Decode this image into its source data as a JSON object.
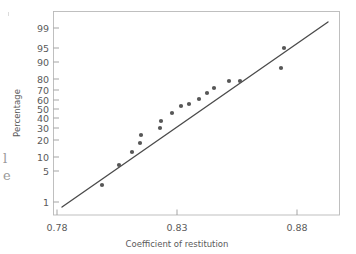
{
  "figure": {
    "kind": "normal-probability-plot",
    "background_color": "#ffffff",
    "line_color": "#4b4b4b",
    "point_color": "#575757",
    "frame_color": "#b9b9b9",
    "text_color": "#5a5a5a"
  },
  "margin_notes": {
    "line1": "l",
    "line2": "e"
  },
  "chart_data": {
    "type": "scatter",
    "title": "",
    "subtitle": "",
    "xlabel": "Coefficient of restitution",
    "ylabel": "Percentage",
    "xlim": [
      0.78,
      0.885
    ],
    "x_ticks": [
      0.78,
      0.83,
      0.88
    ],
    "x_tick_labels": [
      "0.78",
      "0.83",
      "0.88"
    ],
    "y_scale": "normal-probability",
    "y_ticks": [
      1,
      5,
      10,
      20,
      30,
      40,
      50,
      60,
      70,
      80,
      90,
      95,
      99
    ],
    "y_tick_labels": [
      "1",
      "5",
      "10",
      "20",
      "30",
      "40",
      "50",
      "60",
      "70",
      "80",
      "90",
      "95",
      "99"
    ],
    "grid": false,
    "legend": null,
    "legend_position": "none",
    "series": [
      {
        "name": "Coefficient of restitution sample",
        "marker": "filled-circle",
        "x": [
          0.8005,
          0.8075,
          0.8125,
          0.8155,
          0.816,
          0.8235,
          0.824,
          0.8285,
          0.832,
          0.835,
          0.839,
          0.842,
          0.845,
          0.851,
          0.8555,
          0.872,
          0.874
        ],
        "y": [
          4,
          10,
          17,
          23,
          30,
          36,
          42,
          48,
          55,
          57,
          62,
          69,
          74,
          81,
          81,
          89,
          96
        ],
        "percentages": [
          4,
          10,
          17,
          23,
          30,
          36,
          42,
          48,
          55,
          57,
          62,
          69,
          74,
          81,
          81,
          89,
          96
        ]
      }
    ],
    "reference_line": {
      "name": "normal fit line",
      "x_start": 0.7815,
      "y_start": 1.1,
      "x_end": 0.8835,
      "y_end": 99.2
    },
    "point_pixels": [
      [
        102,
        185
      ],
      [
        119,
        165
      ],
      [
        132,
        152
      ],
      [
        140,
        143
      ],
      [
        141,
        135
      ],
      [
        160,
        128
      ],
      [
        161,
        121
      ],
      [
        172,
        113
      ],
      [
        181,
        106
      ],
      [
        189,
        104
      ],
      [
        199,
        99
      ],
      [
        207,
        93
      ],
      [
        214,
        88
      ],
      [
        229,
        81
      ],
      [
        240,
        81
      ],
      [
        281,
        68
      ],
      [
        284,
        48
      ]
    ],
    "line_pixels": {
      "x1": 62,
      "y1": 207,
      "x2": 328,
      "y2": 22
    },
    "y_tick_pixels": [
      {
        "value": "99",
        "y": 28
      },
      {
        "value": "95",
        "y": 48
      },
      {
        "value": "90",
        "y": 62
      },
      {
        "value": "80",
        "y": 79
      },
      {
        "value": "70",
        "y": 90
      },
      {
        "value": "60",
        "y": 100
      },
      {
        "value": "50",
        "y": 109
      },
      {
        "value": "40",
        "y": 118
      },
      {
        "value": "30",
        "y": 128
      },
      {
        "value": "20",
        "y": 140
      },
      {
        "value": "10",
        "y": 157
      },
      {
        "value": "5",
        "y": 171
      },
      {
        "value": "1",
        "y": 202
      }
    ],
    "x_tick_pixels": [
      {
        "value": "0.78",
        "x": 57
      },
      {
        "value": "0.83",
        "x": 177
      },
      {
        "value": "0.88",
        "x": 297
      }
    ],
    "plot_frame_pixels": {
      "left": 53,
      "top": 11,
      "right": 340,
      "bottom": 215
    }
  }
}
